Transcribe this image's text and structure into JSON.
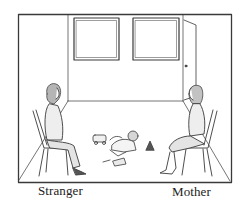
{
  "illustration": {
    "subject": "Observation room scene",
    "labels": {
      "stranger": "Stranger",
      "mother": "Mother"
    },
    "elements": [
      "room-frame",
      "window-left",
      "window-right",
      "door",
      "stranger-on-chair",
      "mother-on-chair",
      "infant",
      "toys"
    ],
    "colors": {
      "line": "#3a3a3a",
      "background": "#ffffff",
      "hair": "#9a9a9a"
    }
  }
}
